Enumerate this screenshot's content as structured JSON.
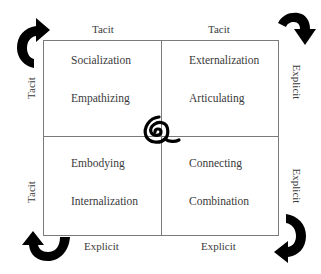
{
  "diagram": {
    "type": "SECI knowledge conversion model",
    "quadrants": {
      "top_left": {
        "process": "Socialization",
        "activity": "Empathizing"
      },
      "top_right": {
        "process": "Externalization",
        "activity": "Articulating"
      },
      "bottom_left": {
        "process": "Embodying",
        "activity": "Internalization"
      },
      "bottom_right": {
        "process": "Connecting",
        "activity": "Combination"
      }
    },
    "edge_labels": {
      "top_left": "Tacit",
      "top_right": "Tacit",
      "bottom_left": "Explicit",
      "bottom_right": "Explicit",
      "left_top": "Tacit",
      "left_bottom": "Tacit",
      "right_top": "Explicit",
      "right_bottom": "Explicit"
    },
    "icons": {
      "center": "spiral-icon",
      "top_left_arrow": "curved-arrow-up-right-icon",
      "top_right_arrow": "curved-arrow-down-icon",
      "bottom_right_arrow": "curved-arrow-down-left-icon",
      "bottom_left_arrow": "curved-arrow-up-icon"
    },
    "colors": {
      "lines": "#7a7a7a",
      "text": "#3a3a3a",
      "arrows": "#000000",
      "background": "#ffffff"
    }
  }
}
